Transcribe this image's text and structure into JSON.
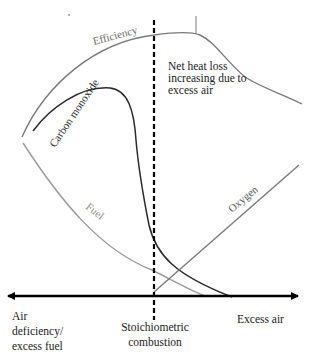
{
  "diagram": {
    "type": "combustion-curves",
    "colors": {
      "axis": "#000000",
      "stoichiometric_line": "#000000",
      "efficiency": "#7a7a7a",
      "carbon_monoxide": "#2a2a2a",
      "fuel": "#9a9a9a",
      "oxygen": "#7a7a7a",
      "text": "#1a1a1a"
    },
    "curves": [
      {
        "name": "Efficiency",
        "label": "Efficiency"
      },
      {
        "name": "Carbon monoxide",
        "label": "Carbon monoxide"
      },
      {
        "name": "Fuel",
        "label": "Fuel"
      },
      {
        "name": "Oxygen",
        "label": "Oxygen"
      }
    ],
    "annotations": {
      "net_heat_loss": "Net heat loss\nincreasing due to\nexcess air"
    },
    "axis_labels": {
      "left": "Air\ndeficiency/\nexcess fuel",
      "center": "Stoichiometric\ncombustion",
      "right": "Excess air"
    }
  }
}
